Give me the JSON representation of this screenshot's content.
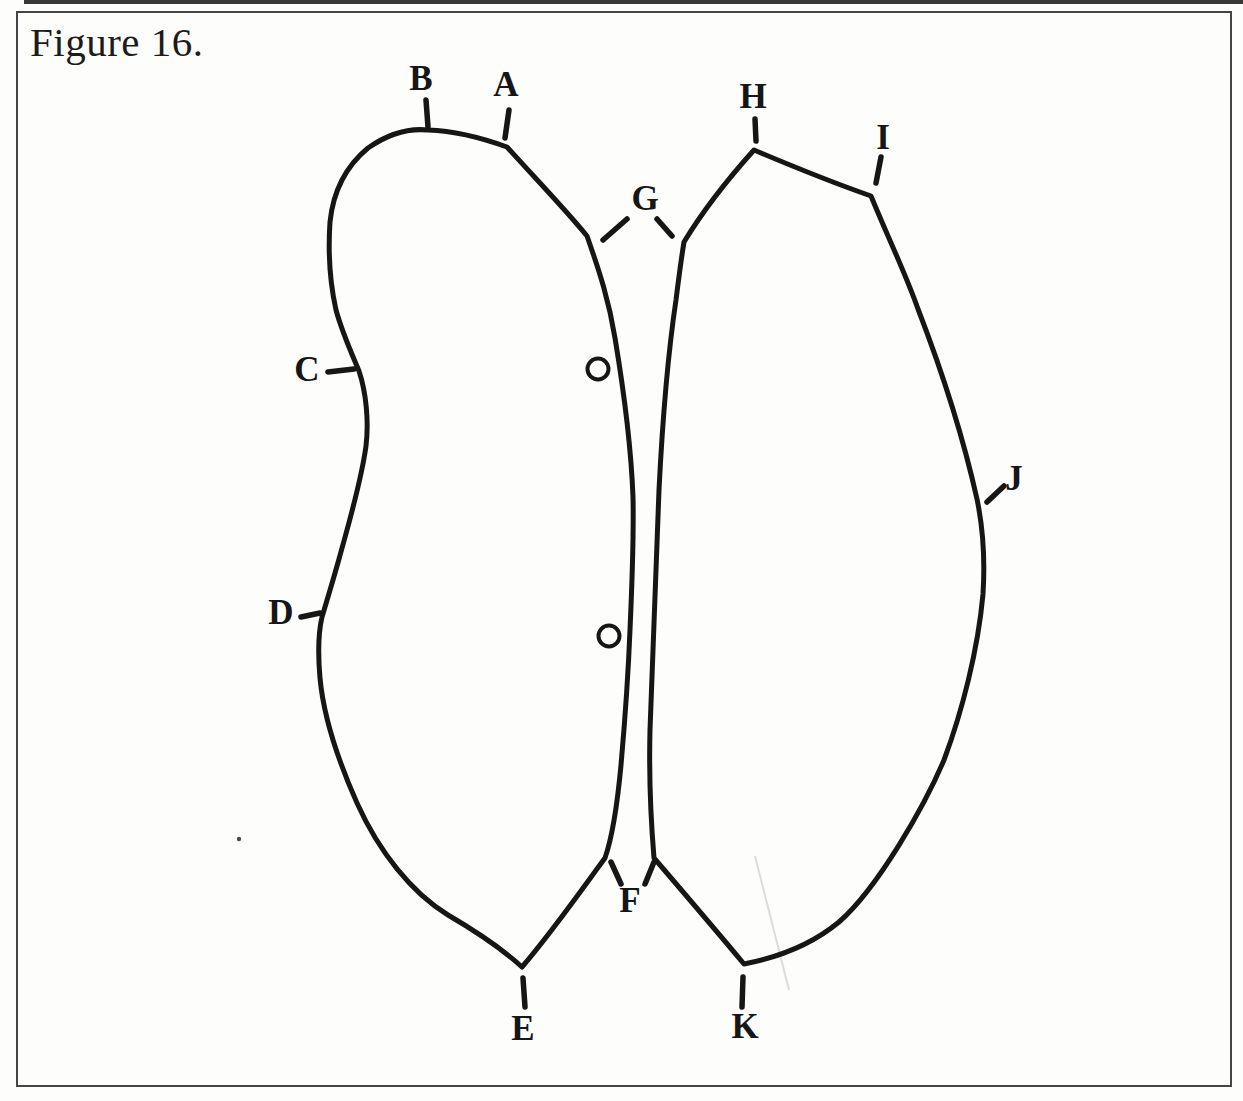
{
  "figure": {
    "title": "Figure 16."
  },
  "drawing": {
    "ink_color": "#161616",
    "paper_color": "#fdfdfb",
    "part_labels": [
      {
        "letter": "A"
      },
      {
        "letter": "B"
      },
      {
        "letter": "C"
      },
      {
        "letter": "D"
      },
      {
        "letter": "E"
      },
      {
        "letter": "F"
      },
      {
        "letter": "G"
      },
      {
        "letter": "H"
      },
      {
        "letter": "I"
      },
      {
        "letter": "J"
      },
      {
        "letter": "K"
      }
    ],
    "small_circles_count": "2"
  }
}
